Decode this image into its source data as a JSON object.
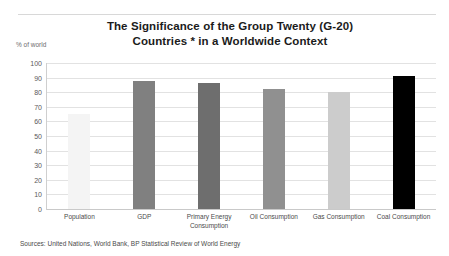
{
  "title": {
    "line1": "The Significance of the Group Twenty (G-20)",
    "line2": "Countries * in a Worldwide Context"
  },
  "axis_unit_label": "% of world",
  "sources": "Sources: United Nations, World Bank, BP Statistical Review of World Energy",
  "chart_data": {
    "type": "bar",
    "title": "The Significance of the Group Twenty (G-20) Countries * in a Worldwide Context",
    "xlabel": "",
    "ylabel": "% of world",
    "ylim": [
      0,
      100
    ],
    "yticks": [
      100,
      90,
      80,
      70,
      60,
      50,
      40,
      30,
      20,
      10,
      0
    ],
    "grid": true,
    "legend": "none",
    "categories": [
      "Population",
      "GDP",
      "Primary Energy Consumption",
      "Oil Consumption",
      "Gas Consumption",
      "Coal Consumption"
    ],
    "values": [
      65,
      88,
      86,
      82,
      80,
      91
    ],
    "colors": [
      "#f4f4f4",
      "#808080",
      "#6e6e6e",
      "#909090",
      "#cccccc",
      "#000000"
    ]
  }
}
